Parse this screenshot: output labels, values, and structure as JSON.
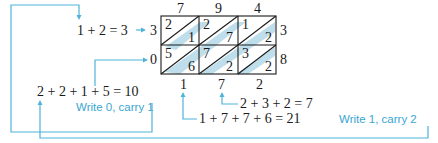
{
  "lattice": {
    "top_digits": [
      "7",
      "9",
      "4"
    ],
    "right_digits": [
      "3",
      "8"
    ],
    "cells": [
      [
        {
          "tens": "2",
          "ones": "1"
        },
        {
          "tens": "2",
          "ones": "7"
        },
        {
          "tens": "1",
          "ones": "2"
        }
      ],
      [
        {
          "tens": "5",
          "ones": "6"
        },
        {
          "tens": "7",
          "ones": "2"
        },
        {
          "tens": "3",
          "ones": "2"
        }
      ]
    ],
    "result_left": [
      "3",
      "0"
    ],
    "result_bottom": [
      "1",
      "7",
      "2"
    ]
  },
  "equations": {
    "diag1": "1 + 2 = 3",
    "diag1_result": "3",
    "diag_left": "2 + 2 + 1 + 5 = 10",
    "diag_mid": "2 + 3 + 2 = 7",
    "diag_big": "1 + 7 + 7 + 6 = 21"
  },
  "notes": {
    "carry1": "Write 0, carry 1",
    "carry2": "Write 1, carry 2"
  },
  "colors": {
    "accent": "#4fb3d9",
    "band": "#a9d3e6",
    "text": "#1a1a1a"
  }
}
